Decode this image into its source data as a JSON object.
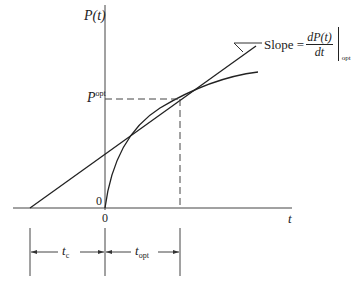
{
  "diagram": {
    "type": "optimal-replacement-time-graph",
    "axes": {
      "y_label_main": "P",
      "y_label_arg": "(t)",
      "x_label": "t",
      "y_origin_label": "0",
      "x_origin_label": "0"
    },
    "p_opt_label": {
      "main": "P",
      "superscript": "opt"
    },
    "slope_annotation": {
      "prefix": "Slope =",
      "numerator": "dP(t)",
      "denominator": "dt",
      "eval_subscript": "opt"
    },
    "intervals": [
      {
        "main": "t",
        "subscript": "c"
      },
      {
        "main": "t",
        "subscript": "opt"
      }
    ],
    "colors": {
      "line": "#222222",
      "background": "#ffffff"
    }
  }
}
